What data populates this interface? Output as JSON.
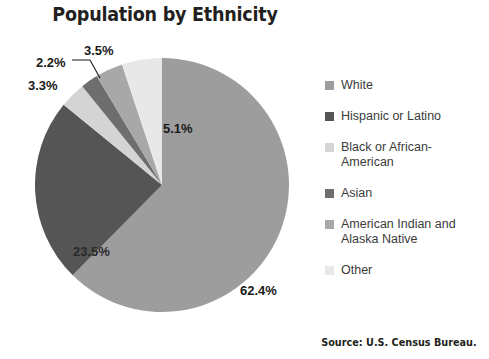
{
  "chart_data": {
    "type": "pie",
    "title": "Population by Ethnicity",
    "source": "Source: U.S. Census Bureau.",
    "categories": [
      "White",
      "Hispanic or Latino",
      "Black or African-American",
      "Asian",
      "American Indian and Alaska Native",
      "Other"
    ],
    "values": [
      62.4,
      23.5,
      3.3,
      2.2,
      3.5,
      5.1
    ],
    "value_labels": [
      "62.4%",
      "23.5%",
      "3.3%",
      "2.2%",
      "3.5%",
      "5.1%"
    ],
    "colors": [
      "#9d9d9d",
      "#555555",
      "#d4d4d4",
      "#6e6e6e",
      "#a8a8a8",
      "#e8e8e8"
    ],
    "start_angle_deg": 0,
    "direction": "clockwise",
    "legend_position": "right",
    "grid": false,
    "xlabel": "",
    "ylabel": ""
  },
  "legend": {
    "items": [
      {
        "label": "White",
        "color": "#9d9d9d"
      },
      {
        "label": "Hispanic or Latino",
        "color": "#555555"
      },
      {
        "label": "Black or African-American",
        "color": "#d4d4d4"
      },
      {
        "label": "Asian",
        "color": "#6e6e6e"
      },
      {
        "label": "American Indian and Alaska Native",
        "color": "#a8a8a8"
      },
      {
        "label": "Other",
        "color": "#e8e8e8"
      }
    ]
  }
}
